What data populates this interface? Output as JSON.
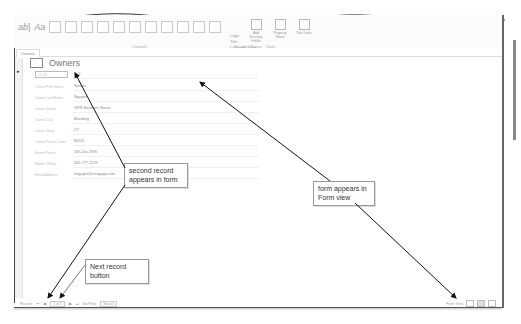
{
  "ribbon": {
    "groups": [
      {
        "label": "Controls"
      },
      {
        "label": "Header / Footer"
      },
      {
        "label": "Tools"
      }
    ],
    "header_footer_items": [
      "Logo",
      "Title",
      "Date and Time"
    ],
    "tools": [
      {
        "label": "Add Existing Fields"
      },
      {
        "label": "Property Sheet"
      },
      {
        "label": "Tab Order"
      }
    ]
  },
  "document_tab": {
    "label": "Owners"
  },
  "form": {
    "title": "Owners",
    "fields": [
      {
        "label": "CL ID",
        "value": "O-2"
      },
      {
        "label": "Owner First Name",
        "value": "Steven"
      },
      {
        "label": "Owner Last Name",
        "value": "Nguyen"
      },
      {
        "label": "Owner Street",
        "value": "1878 Southern Street"
      },
      {
        "label": "Owner City",
        "value": "Blanding"
      },
      {
        "label": "Owner State",
        "value": "UT"
      },
      {
        "label": "Owner Postal Code",
        "value": "84511"
      },
      {
        "label": "Home Phone",
        "value": "435-4xx-7695"
      },
      {
        "label": "Mobile Phone",
        "value": "435-777-1219"
      },
      {
        "label": "Email Address",
        "value": "nnguyen@cengage.com"
      }
    ]
  },
  "callouts": {
    "second_record": "second record appears in form",
    "form_view": "form appears in Form view",
    "next_record": "Next record button"
  },
  "status_bar": {
    "record_label": "Record:",
    "first": "⏮",
    "prev": "◀",
    "position": "2 of 2",
    "next": "▶",
    "last": "⏭",
    "filter": "No Filter",
    "search": "Search",
    "mode": "Form View"
  }
}
